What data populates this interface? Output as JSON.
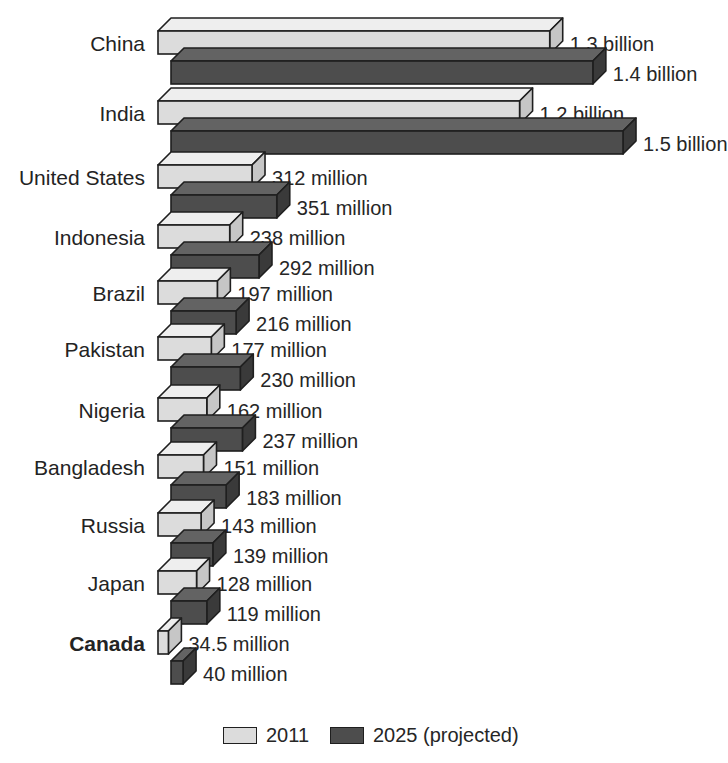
{
  "chart_data": {
    "type": "bar",
    "title": "",
    "subtitle": "",
    "xlabel": "",
    "ylabel": "",
    "orientation": "horizontal",
    "grid": false,
    "legend_position": "bottom",
    "units": "people",
    "axis_range_millions": [
      0,
      1500
    ],
    "categories": [
      "China",
      "India",
      "United States",
      "Indonesia",
      "Brazil",
      "Pakistan",
      "Nigeria",
      "Bangladesh",
      "Russia",
      "Japan",
      "Canada"
    ],
    "series": [
      {
        "name": "2011",
        "color": "#dcdcdc",
        "values_millions": [
          1300,
          1200,
          312,
          238,
          197,
          177,
          162,
          151,
          143,
          128,
          34.5
        ],
        "labels": [
          "1.3 billion",
          "1.2 billion",
          "312 million",
          "238 million",
          "197 million",
          "177 million",
          "162 million",
          "151 million",
          "143 million",
          "128 million",
          "34.5 million"
        ]
      },
      {
        "name": "2025 (projected)",
        "color": "#4d4d4d",
        "values_millions": [
          1400,
          1500,
          351,
          292,
          216,
          230,
          237,
          183,
          139,
          119,
          40
        ],
        "labels": [
          "1.4 billion",
          "1.5 billion",
          "351 million",
          "292 million",
          "216 million",
          "230 million",
          "237 million",
          "183 million",
          "139 million",
          "119 million",
          "40 million"
        ]
      }
    ],
    "highlighted_category": "Canada"
  },
  "legend": {
    "items": [
      {
        "label": "2011",
        "color": "#dcdcdc"
      },
      {
        "label": "2025 (projected)",
        "color": "#4d4d4d"
      }
    ]
  },
  "colors": {
    "background": "#ffffff",
    "light_front": "#dcdcdc",
    "light_top": "#eeeeee",
    "light_side": "#c6c6c6",
    "dark_front": "#4d4d4d",
    "dark_top": "#636363",
    "dark_side": "#3a3a3a",
    "outline": "#1f1f1f",
    "text": "#262626"
  }
}
